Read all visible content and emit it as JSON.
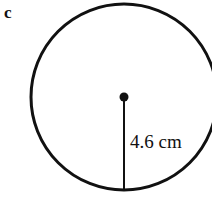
{
  "figure": {
    "part_label": "c",
    "background_color": "#ffffff",
    "ink_color": "#111111",
    "width": 212,
    "height": 211
  },
  "chart_data": {
    "type": "diagram",
    "title": "",
    "subtitle": "",
    "xlabel": "",
    "ylabel": "",
    "shape": "circle",
    "part_label": "c",
    "measurement_label": "4.6 cm",
    "measurement_value": 4.6,
    "measurement_unit": "cm",
    "measured_quantity": "radius",
    "annotations": [
      "c",
      "4.6 cm"
    ],
    "legend": [],
    "grid": false,
    "geometry": {
      "circle_center_x": 124,
      "circle_center_y": 97,
      "circle_radius": 93,
      "circle_stroke_width": 3,
      "center_dot_radius": 4.5,
      "radius_line_from_x": 124,
      "radius_line_from_y": 97,
      "radius_line_to_x": 124,
      "radius_line_to_y": 190,
      "radius_line_stroke_width": 2,
      "clipped_edges": [
        "right"
      ]
    }
  }
}
